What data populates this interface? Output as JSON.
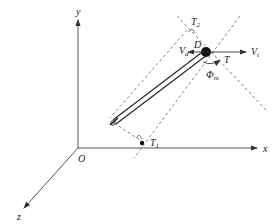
{
  "diagram": {
    "type": "3D coordinate diagram of tethered body",
    "axes": {
      "x_label": "x",
      "y_label": "y",
      "z_label": "z",
      "origin_label": "O"
    },
    "labels": {
      "D": "D",
      "V_d_main": "V",
      "V_d_sub": "d",
      "V_t_main": "V",
      "V_t_sub": "t",
      "T": "T",
      "Phi_main": "Φ",
      "Phi_sub": "m",
      "T2_main": "T",
      "T2_sub": "2",
      "T1_main": "T",
      "T1_sub": "1"
    },
    "colors": {
      "line": "#333333",
      "dashed": "#666666",
      "background": "#ffffff"
    }
  }
}
